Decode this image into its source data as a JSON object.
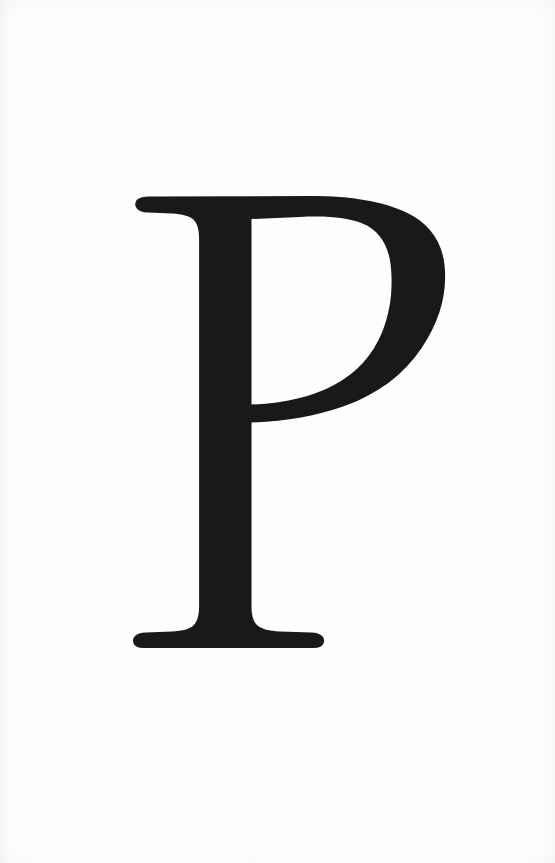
{
  "document": {
    "kind": "typographic-plate",
    "page_background_color": "#fefefe",
    "ink_color": "#191919",
    "canvas": {
      "width": 555,
      "height": 863
    }
  },
  "glyph": {
    "character": "P",
    "name": "latin-capital-letter-p",
    "style": "serif",
    "fill_color": "#191919",
    "bounds": {
      "left": 135,
      "top": 196,
      "right": 444,
      "bottom": 648,
      "width": 309,
      "height": 452
    },
    "parts": {
      "top_serif_label": "top serif",
      "stem_label": "vertical stem",
      "bowl_label": "bowl",
      "counter_label": "counter",
      "foot_serif_label": "foot serif"
    }
  },
  "caption": {
    "text": ""
  }
}
